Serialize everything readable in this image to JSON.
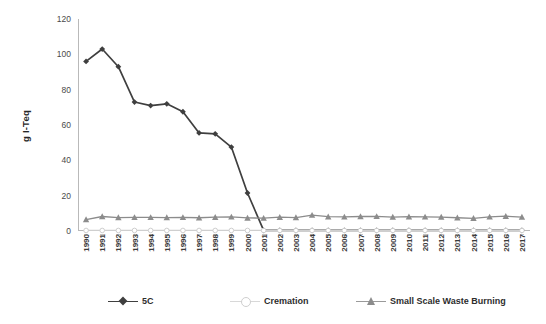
{
  "chart_data": {
    "type": "line",
    "title": "",
    "xlabel": "",
    "ylabel": "g I-Teq",
    "ylim": [
      0,
      120
    ],
    "yticks": [
      0,
      20,
      40,
      60,
      80,
      100,
      120
    ],
    "grid": false,
    "legend_position": "bottom",
    "categories": [
      "1990",
      "1991",
      "1992",
      "1993",
      "1994",
      "1995",
      "1996",
      "1997",
      "1998",
      "1999",
      "2000",
      "2001",
      "2002",
      "2003",
      "2004",
      "2005",
      "2006",
      "2007",
      "2008",
      "2009",
      "2010",
      "2011",
      "2012",
      "2013",
      "2014",
      "2015",
      "2016",
      "2017"
    ],
    "series": [
      {
        "name": "5C",
        "color": "#3f3f3f",
        "marker": "diamond",
        "values": [
          96,
          103,
          93,
          73,
          71,
          72,
          67.5,
          55.5,
          55,
          47.5,
          21.5,
          0.4,
          0.4,
          0.4,
          0.4,
          0.4,
          0.4,
          0.4,
          0.4,
          0.4,
          0.4,
          0.4,
          0.4,
          0.4,
          0.4,
          0.4,
          0.4,
          0.4
        ]
      },
      {
        "name": "Cremation",
        "color": "#cfcfcf",
        "marker": "circle",
        "values": [
          0.3,
          0.3,
          0.3,
          0.3,
          0.3,
          0.3,
          0.3,
          0.3,
          0.3,
          0.3,
          0.3,
          0.3,
          0.3,
          0.3,
          0.3,
          0.3,
          0.3,
          0.3,
          0.3,
          0.3,
          0.3,
          0.3,
          0.3,
          0.3,
          0.3,
          0.3,
          0.3,
          0.3
        ]
      },
      {
        "name": "Small Scale Waste Burning",
        "color": "#8c8c8c",
        "marker": "triangle",
        "values": [
          6.5,
          8.2,
          7.6,
          7.7,
          7.7,
          7.6,
          7.7,
          7.5,
          7.8,
          8.0,
          7.4,
          7.3,
          7.8,
          7.6,
          9.0,
          8.1,
          8.0,
          8.2,
          8.3,
          7.9,
          8.1,
          8.0,
          7.9,
          7.5,
          7.2,
          8.0,
          8.4,
          7.9
        ]
      }
    ]
  },
  "legend": {
    "items": [
      {
        "label": "5C"
      },
      {
        "label": "Cremation"
      },
      {
        "label": "Small Scale Waste Burning"
      }
    ]
  }
}
